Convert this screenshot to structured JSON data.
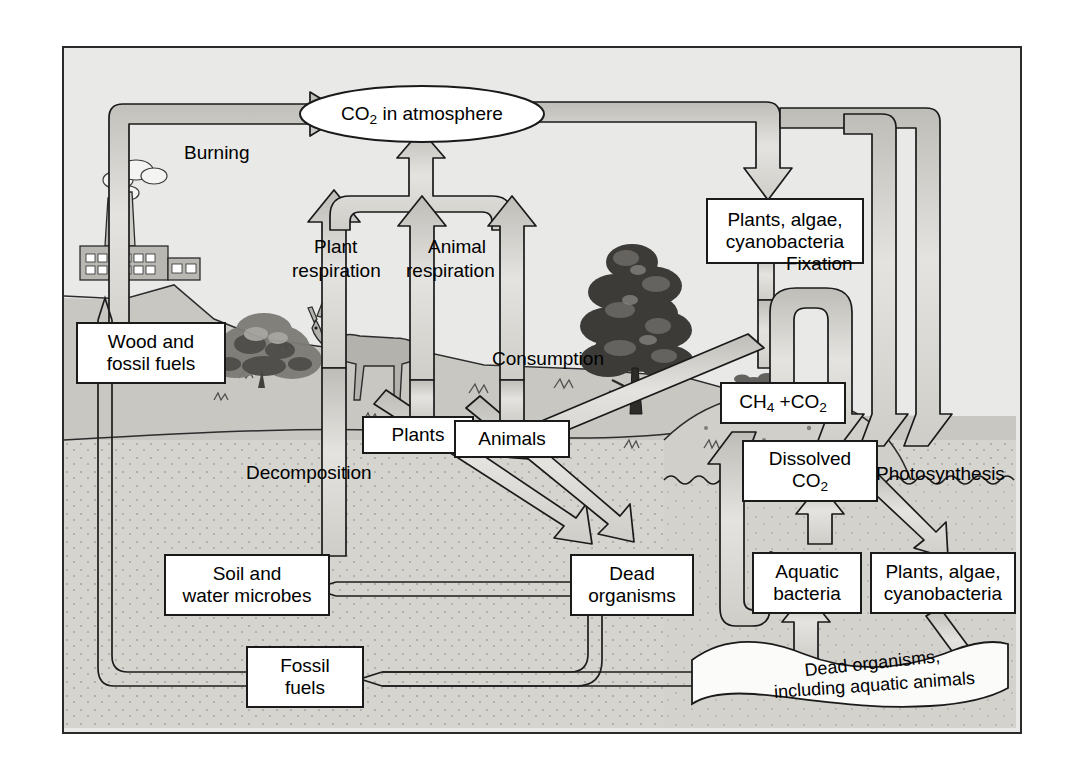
{
  "figure": {
    "background_color": "#e9e9e7",
    "border_color": "#2b2b2b",
    "land_color": "#c9c7c2",
    "soil_color": "#d6d4cf",
    "water_color": "#d2d0cb",
    "arrow_fill": "#d8d7d3",
    "arrow_stroke": "#1a1a1a",
    "box_fill": "#ffffff"
  },
  "nodes": {
    "co2_atmosphere": {
      "label_html": "CO<sub>2</sub> in atmosphere",
      "label": "CO2 in atmosphere",
      "shape": "ellipse"
    },
    "wood_fossil_fuels": {
      "line1": "Wood and",
      "line2": "fossil fuels",
      "shape": "box"
    },
    "plants": {
      "line1": "Plants",
      "line2": "",
      "shape": "box"
    },
    "animals": {
      "line1": "Animals",
      "line2": "",
      "shape": "box"
    },
    "terrestrial_producers": {
      "line1": "Plants, algae,",
      "line2": "cyanobacteria",
      "shape": "box"
    },
    "ch4_co2": {
      "label_html": "CH<sub>4</sub> +CO<sub>2</sub>",
      "label": "CH4 +CO2",
      "shape": "box"
    },
    "dissolved_co2": {
      "line1": "Dissolved",
      "line2_html": "CO<sub>2</sub>",
      "line2": "CO2",
      "shape": "box"
    },
    "soil_water_microbes": {
      "line1": "Soil and",
      "line2": "water microbes",
      "shape": "box"
    },
    "dead_organisms": {
      "line1": "Dead",
      "line2": "organisms",
      "shape": "box"
    },
    "aquatic_bacteria": {
      "line1": "Aquatic",
      "line2": "bacteria",
      "shape": "box"
    },
    "aquatic_producers": {
      "line1": "Plants, algae,",
      "line2": "cyanobacteria",
      "shape": "box"
    },
    "fossil_fuels": {
      "line1": "Fossil",
      "line2": "fuels",
      "shape": "box"
    },
    "dead_organisms_aquatic": {
      "line1": "Dead organisms,",
      "line2": "including aquatic animals",
      "shape": "ribbon"
    }
  },
  "process_labels": {
    "burning": "Burning",
    "plant_respiration_1": "Plant",
    "plant_respiration_2": "respiration",
    "animal_respiration_1": "Animal",
    "animal_respiration_2": "respiration",
    "fixation": "Fixation",
    "consumption": "Consumption",
    "decomposition": "Decomposition",
    "photosynthesis": "Photosynthesis"
  },
  "scenery": {
    "factory": "factory-icon",
    "smoke": "smoke-icon",
    "shrub": "shrub-icon",
    "deer": "deer-icon",
    "conifer": "conifer-tree-icon",
    "hill": "hill-icon",
    "waterline": "wavy-waterline-icon"
  },
  "flows": [
    {
      "from": "wood_fossil_fuels",
      "to": "co2_atmosphere",
      "label": "Burning",
      "style": "hollow-pipe"
    },
    {
      "from": "plants",
      "to": "co2_atmosphere",
      "label": "Plant respiration",
      "style": "hollow-pipe"
    },
    {
      "from": "animals",
      "to": "co2_atmosphere",
      "label": "Animal respiration",
      "style": "hollow-pipe"
    },
    {
      "from": "soil_water_microbes",
      "to": "co2_atmosphere",
      "label": "",
      "style": "hollow-pipe"
    },
    {
      "from": "co2_atmosphere",
      "to": "terrestrial_producers",
      "label": "",
      "style": "hollow-pipe"
    },
    {
      "from": "co2_atmosphere",
      "to": "dissolved_co2",
      "label": "",
      "style": "hollow-pipe"
    },
    {
      "from": "terrestrial_producers",
      "to": "plants",
      "label": "Fixation",
      "style": "hollow-pipe"
    },
    {
      "from": "plants",
      "to": "animals",
      "label": "Consumption",
      "style": "hollow-pipe"
    },
    {
      "from": "plants",
      "to": "dead_organisms",
      "label": "",
      "style": "hollow-pipe"
    },
    {
      "from": "animals",
      "to": "dead_organisms",
      "label": "",
      "style": "hollow-pipe"
    },
    {
      "from": "dead_organisms",
      "to": "soil_water_microbes",
      "label": "Decomposition",
      "style": "thin-line"
    },
    {
      "from": "dead_organisms",
      "to": "fossil_fuels",
      "label": "",
      "style": "thin-line"
    },
    {
      "from": "fossil_fuels",
      "to": "wood_fossil_fuels",
      "label": "",
      "style": "thin-line"
    },
    {
      "from": "ch4_co2",
      "to": "dissolved_co2",
      "label": "",
      "style": "hollow-pipe"
    },
    {
      "from": "aquatic_bacteria",
      "to": "ch4_co2",
      "label": "",
      "style": "hollow-pipe"
    },
    {
      "from": "aquatic_bacteria",
      "to": "dissolved_co2",
      "label": "",
      "style": "hollow-pipe"
    },
    {
      "from": "dissolved_co2",
      "to": "aquatic_producers",
      "label": "Photosynthesis",
      "style": "hollow-pipe"
    },
    {
      "from": "aquatic_producers",
      "to": "dead_organisms_aquatic",
      "label": "",
      "style": "hollow-pipe"
    },
    {
      "from": "dead_organisms_aquatic",
      "to": "aquatic_bacteria",
      "label": "",
      "style": "hollow-pipe"
    },
    {
      "from": "dead_organisms_aquatic",
      "to": "fossil_fuels",
      "label": "",
      "style": "thin-line"
    }
  ]
}
